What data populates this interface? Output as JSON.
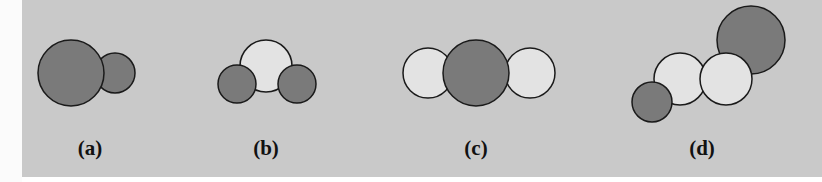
{
  "figure": {
    "colors": {
      "background": "#c9c9c9",
      "dark_atom": "#7a7a7a",
      "light_atom": "#e3e3e3",
      "outline": "#1a1a1a"
    },
    "panels": [
      {
        "id": "a",
        "label": "(a)",
        "description": "diatomic molecule: large dark atom bonded to small dark atom"
      },
      {
        "id": "b",
        "label": "(b)",
        "description": "bent triatomic molecule: light central atom with two dark atoms"
      },
      {
        "id": "c",
        "label": "(c)",
        "description": "linear triatomic molecule: dark central atom with two light atoms"
      },
      {
        "id": "d",
        "label": "(d)",
        "description": "four-atom chain: small dark, two light, large dark atom"
      }
    ]
  }
}
